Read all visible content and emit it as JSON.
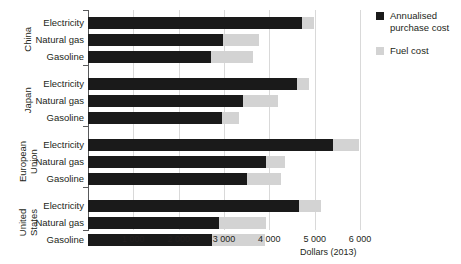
{
  "chart_data": {
    "type": "bar",
    "orientation": "horizontal",
    "stacked": true,
    "title": "",
    "xlabel": "Dollars (2013)",
    "ylabel": "",
    "xlim": [
      0,
      6000
    ],
    "xticks": [
      1000,
      2000,
      3000,
      4000,
      5000,
      6000
    ],
    "xtick_labels": [
      "1 000",
      "2 000",
      "3 000",
      "4 000",
      "5 000",
      "6 000"
    ],
    "grid": true,
    "legend_position": "right",
    "series": [
      {
        "name": "Annualised purchase cost",
        "color": "#1a1a1a",
        "values": [
          4730,
          2980,
          2710,
          4600,
          3420,
          2960,
          5410,
          3920,
          3500,
          4660,
          2880,
          2740
        ]
      },
      {
        "name": "Fuel cost",
        "color": "#d3d3d3",
        "values": [
          250,
          800,
          930,
          270,
          780,
          380,
          560,
          430,
          750,
          490,
          1050,
          1160
        ]
      }
    ],
    "groups": [
      {
        "name": "China",
        "categories": [
          "Electricity",
          "Natural gas",
          "Gasoline"
        ],
        "purchase_cost": [
          4730,
          2980,
          2710
        ],
        "fuel_cost": [
          250,
          800,
          930
        ],
        "total": [
          4980,
          3780,
          3640
        ]
      },
      {
        "name": "Japan",
        "categories": [
          "Electricity",
          "Natural gas",
          "Gasoline"
        ],
        "purchase_cost": [
          4600,
          3420,
          2960
        ],
        "fuel_cost": [
          270,
          780,
          380
        ],
        "total": [
          4870,
          4200,
          3340
        ]
      },
      {
        "name": "European Union",
        "categories": [
          "Electricity",
          "Natural gas",
          "Gasoline"
        ],
        "purchase_cost": [
          5410,
          3920,
          3500
        ],
        "fuel_cost": [
          560,
          430,
          750
        ],
        "total": [
          5970,
          4350,
          4250
        ]
      },
      {
        "name": "United States",
        "categories": [
          "Electricity",
          "Natural gas",
          "Gasoline"
        ],
        "purchase_cost": [
          4660,
          2880,
          2740
        ],
        "fuel_cost": [
          490,
          1050,
          1160
        ],
        "total": [
          5150,
          3930,
          3900
        ]
      }
    ]
  },
  "axis": {
    "x_title": "Dollars (2013)",
    "ticks": [
      {
        "value": 1000,
        "label": "1 000"
      },
      {
        "value": 2000,
        "label": "2 000"
      },
      {
        "value": 3000,
        "label": "3 000"
      },
      {
        "value": 4000,
        "label": "4 000"
      },
      {
        "value": 5000,
        "label": "5 000"
      },
      {
        "value": 6000,
        "label": "6 000"
      }
    ]
  },
  "groups": [
    {
      "name": "China",
      "line1": "China",
      "line2": ""
    },
    {
      "name": "Japan",
      "line1": "Japan",
      "line2": ""
    },
    {
      "name": "European Union",
      "line1": "European",
      "line2": "Union"
    },
    {
      "name": "United States",
      "line1": "United",
      "line2": "States"
    }
  ],
  "category_labels": [
    "Electricity",
    "Natural gas",
    "Gasoline"
  ],
  "legend": {
    "items": [
      {
        "label_line1": "Annualised",
        "label_line2": "purchase cost",
        "color": "#1a1a1a",
        "swatch": "dark-swatch"
      },
      {
        "label_line1": "Fuel cost",
        "label_line2": "",
        "color": "#d3d3d3",
        "swatch": "light-swatch"
      }
    ]
  }
}
